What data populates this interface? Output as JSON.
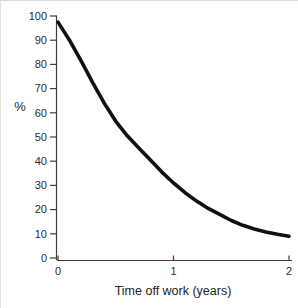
{
  "figure": {
    "background": "#ffffff",
    "axis_color": "#3d3d3d",
    "curve_color": "#101010",
    "label_color": "#2b2b2b"
  },
  "chart_data": {
    "type": "line",
    "title": "",
    "xlabel": "Time off work (years)",
    "ylabel": "%",
    "xlim": [
      0,
      2
    ],
    "ylim": [
      0,
      100
    ],
    "x_ticks": [
      "0",
      "1",
      "2"
    ],
    "x_tick_values": [
      0,
      1,
      2
    ],
    "y_ticks": [
      "0",
      "10",
      "20",
      "30",
      "40",
      "50",
      "60",
      "70",
      "80",
      "90",
      "100"
    ],
    "y_tick_values": [
      0,
      10,
      20,
      30,
      40,
      50,
      60,
      70,
      80,
      90,
      100
    ],
    "grid": false,
    "legend": null,
    "series": [
      {
        "name": "percent-still-off-work",
        "x": [
          0,
          0.1,
          0.2,
          0.3,
          0.4,
          0.5,
          0.6,
          0.7,
          0.8,
          0.9,
          1.0,
          1.1,
          1.2,
          1.3,
          1.4,
          1.5,
          1.6,
          1.7,
          1.8,
          1.9,
          2.0
        ],
        "y": [
          97.5,
          90,
          81.5,
          72.5,
          64,
          56.5,
          50.5,
          45.5,
          40.5,
          35.5,
          31,
          27,
          23.5,
          20.5,
          18,
          15.5,
          13.5,
          12,
          10.8,
          9.8,
          9
        ],
        "color": "#101010",
        "stroke_width": 3.6
      }
    ]
  }
}
